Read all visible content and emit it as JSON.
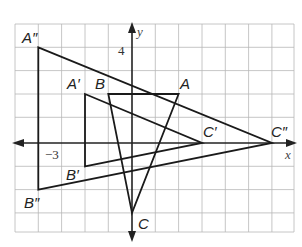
{
  "diagram": {
    "type": "coordinate-plane-dilation",
    "grid": {
      "x_min": -5,
      "x_max": 7,
      "y_min": -4,
      "y_max": 5
    },
    "axes": {
      "x_label": "x",
      "y_label": "y"
    },
    "tick_labels": {
      "x_tick": "−3",
      "y_tick": "4"
    },
    "triangles": [
      {
        "name": "ABC",
        "vertices": {
          "A": [
            2,
            2
          ],
          "B": [
            -1,
            2
          ],
          "C": [
            0,
            -3
          ]
        },
        "labels": [
          "A",
          "B",
          "C"
        ]
      },
      {
        "name": "A'B'C'",
        "vertices": {
          "A'": [
            -2,
            2
          ],
          "B'": [
            -2,
            -1
          ],
          "C'": [
            3,
            0
          ]
        },
        "labels": [
          "A′",
          "B′",
          "C′"
        ]
      },
      {
        "name": "A''B''C''",
        "vertices": {
          "A''": [
            -4,
            4
          ],
          "B''": [
            -4,
            -2
          ],
          "C''": [
            6,
            0
          ]
        },
        "labels": [
          "A″",
          "B″",
          "C″"
        ]
      }
    ]
  }
}
